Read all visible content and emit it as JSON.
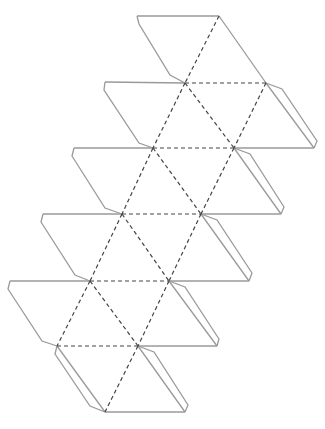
{
  "diagram": {
    "type": "papercraft-net",
    "canvas": {
      "width": 325,
      "height": 429
    },
    "colors": {
      "cut_line": "#9a9a9a",
      "fold_line": "#444444",
      "background": "#ffffff"
    },
    "vertices": {
      "A0": [
        137,
        16
      ],
      "A1": [
        219,
        16
      ],
      "B0": [
        105,
        82
      ],
      "B1": [
        185,
        83
      ],
      "B2": [
        266,
        83
      ],
      "C0": [
        74,
        148
      ],
      "C1": [
        153,
        148
      ],
      "C2": [
        234,
        148
      ],
      "C3": [
        314,
        148
      ],
      "D0": [
        43,
        214
      ],
      "D1": [
        122,
        214
      ],
      "D2": [
        201,
        214
      ],
      "D3": [
        281,
        214
      ],
      "E0": [
        10,
        281
      ],
      "E1": [
        90,
        281
      ],
      "E2": [
        169,
        281
      ],
      "E3": [
        249,
        281
      ],
      "F1": [
        57,
        346
      ],
      "F2": [
        138,
        346
      ],
      "F3": [
        217,
        346
      ],
      "G1": [
        105,
        412
      ],
      "G2": [
        185,
        412
      ]
    },
    "cut_edges": [
      [
        "A0",
        "A1"
      ],
      [
        "A1",
        "B2"
      ],
      [
        "B0",
        "B1"
      ],
      [
        "B2",
        "C3"
      ],
      [
        "C2",
        "C3"
      ],
      [
        "C0",
        "C1"
      ],
      [
        "C2",
        "D3"
      ],
      [
        "D2",
        "D3"
      ],
      [
        "D0",
        "D1"
      ],
      [
        "D2",
        "E3"
      ],
      [
        "E2",
        "E3"
      ],
      [
        "E0",
        "E1"
      ],
      [
        "E2",
        "F3"
      ],
      [
        "F2",
        "F3"
      ],
      [
        "F1",
        "G1"
      ],
      [
        "F2",
        "G2"
      ],
      [
        "G1",
        "G2"
      ]
    ],
    "fold_edges": [
      [
        "A1",
        "B1"
      ],
      [
        "B1",
        "B2"
      ],
      [
        "B1",
        "C1"
      ],
      [
        "B1",
        "C2"
      ],
      [
        "B2",
        "C2"
      ],
      [
        "C1",
        "C2"
      ],
      [
        "C1",
        "D1"
      ],
      [
        "C1",
        "D2"
      ],
      [
        "C2",
        "D2"
      ],
      [
        "D1",
        "D2"
      ],
      [
        "D1",
        "E1"
      ],
      [
        "D1",
        "E2"
      ],
      [
        "D2",
        "E2"
      ],
      [
        "E1",
        "E2"
      ],
      [
        "E1",
        "F1"
      ],
      [
        "E1",
        "F2"
      ],
      [
        "E2",
        "F2"
      ],
      [
        "F1",
        "F2"
      ],
      [
        "F2",
        "G1"
      ]
    ],
    "tabs": [
      {
        "from": "A0",
        "to": "B1",
        "points": [
          [
            137,
            16
          ],
          [
            139,
            24
          ],
          [
            170,
            75
          ],
          [
            185,
            83
          ]
        ]
      },
      {
        "from": "B0",
        "to": "C1",
        "points": [
          [
            105,
            82
          ],
          [
            104,
            90
          ],
          [
            139,
            143
          ],
          [
            153,
            148
          ]
        ]
      },
      {
        "from": "C0",
        "to": "D1",
        "points": [
          [
            74,
            148
          ],
          [
            72,
            156
          ],
          [
            105,
            208
          ],
          [
            122,
            214
          ]
        ]
      },
      {
        "from": "D0",
        "to": "E1",
        "points": [
          [
            43,
            214
          ],
          [
            41,
            222
          ],
          [
            75,
            275
          ],
          [
            90,
            281
          ]
        ]
      },
      {
        "from": "E0",
        "to": "F1",
        "points": [
          [
            10,
            281
          ],
          [
            8,
            289
          ],
          [
            42,
            341
          ],
          [
            57,
            346
          ]
        ]
      },
      {
        "from": "B2",
        "to": "C3",
        "points": [
          [
            266,
            83
          ],
          [
            282,
            89
          ],
          [
            317,
            141
          ],
          [
            314,
            148
          ]
        ]
      },
      {
        "from": "C2",
        "to": "D3",
        "points": [
          [
            234,
            148
          ],
          [
            250,
            154
          ],
          [
            284,
            207
          ],
          [
            281,
            214
          ]
        ]
      },
      {
        "from": "D2",
        "to": "E3",
        "points": [
          [
            201,
            214
          ],
          [
            217,
            220
          ],
          [
            252,
            273
          ],
          [
            249,
            281
          ]
        ]
      },
      {
        "from": "E2",
        "to": "F3",
        "points": [
          [
            169,
            281
          ],
          [
            185,
            287
          ],
          [
            219,
            339
          ],
          [
            217,
            346
          ]
        ]
      },
      {
        "from": "F2",
        "to": "G2",
        "points": [
          [
            138,
            346
          ],
          [
            154,
            352
          ],
          [
            188,
            405
          ],
          [
            185,
            412
          ]
        ]
      },
      {
        "from": "F1",
        "to": "G1",
        "points": [
          [
            57,
            346
          ],
          [
            55,
            354
          ],
          [
            90,
            406
          ],
          [
            105,
            412
          ]
        ]
      }
    ]
  }
}
